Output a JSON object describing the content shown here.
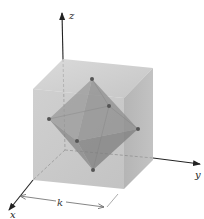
{
  "figure": {
    "axes": {
      "x_label": "x",
      "y_label": "y",
      "z_label": "z"
    },
    "dimension": {
      "label": "k"
    },
    "colors": {
      "cube_top": "#c8c8c8",
      "cube_front": "#bdbdbd",
      "cube_right": "#a9a9a9",
      "octahedron": "#8c8c8c",
      "vertex": "#555555",
      "axis": "#222222"
    },
    "octahedron_vertices": [
      {
        "name": "top",
        "x": 92,
        "y": 79
      },
      {
        "name": "left",
        "x": 49,
        "y": 119
      },
      {
        "name": "right",
        "x": 138,
        "y": 129
      },
      {
        "name": "bottom",
        "x": 93,
        "y": 170
      },
      {
        "name": "back",
        "x": 109,
        "y": 106
      },
      {
        "name": "front",
        "x": 77,
        "y": 141
      }
    ]
  }
}
